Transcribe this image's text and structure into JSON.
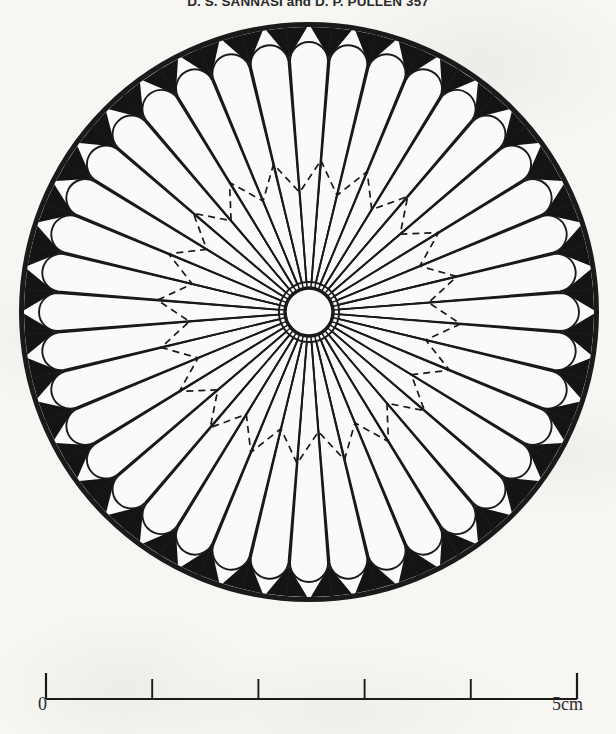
{
  "page": {
    "background_color": "#f7f6f3",
    "ink_color": "#1a1a1a",
    "width": 616,
    "height": 734
  },
  "header": {
    "title": "D. S. SANNASI and D. P. PULLEN 357"
  },
  "figure": {
    "name": "radial-petal-diagram",
    "center_x": 309,
    "center_y": 312,
    "outer_radius": 290,
    "rim_thickness": 5,
    "hub_radius": 24,
    "hub_stroke_width": 3.5,
    "petal_count": 40,
    "petal_inner_radius": 30,
    "petal_outer_radius": 270,
    "petal_tip_radius": 19,
    "spoke_count": 40,
    "dashed_ring": {
      "name": "dashed-zigzag-ring",
      "outer_radius": 152,
      "inner_radius": 120,
      "point_count": 20,
      "dash_pattern": "7 5",
      "stroke_width": 1.7
    },
    "gusset_color": "#141414"
  },
  "scale": {
    "name": "scale-bar",
    "left_label": "0",
    "right_label": "5cm",
    "x_start": 46,
    "x_end": 577,
    "baseline_y": 44,
    "tick_height": 26,
    "minor_tick_height": 20,
    "divisions": 5,
    "units": "cm",
    "total_length": 5
  }
}
